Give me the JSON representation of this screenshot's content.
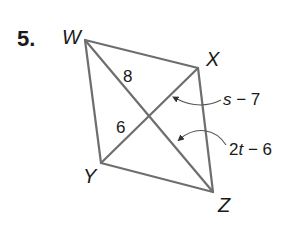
{
  "problem": {
    "number": "5."
  },
  "figure": {
    "type": "rhombus",
    "vertices": {
      "W": {
        "label": "W",
        "x": 85,
        "y": 40
      },
      "X": {
        "label": "X",
        "x": 198,
        "y": 68
      },
      "Y": {
        "label": "Y",
        "x": 101,
        "y": 163
      },
      "Z": {
        "label": "Z",
        "x": 213,
        "y": 192
      }
    },
    "segment_labels": {
      "upper_left_diagonal": "8",
      "lower_left_diagonal": "6"
    },
    "expressions": {
      "first": {
        "var": "s",
        "rest": " − 7"
      },
      "second": {
        "coef": "2",
        "var": "t",
        "rest": " − 6"
      }
    },
    "colors": {
      "edge": "#6e6e6e",
      "text": "#1a1a1a"
    }
  }
}
